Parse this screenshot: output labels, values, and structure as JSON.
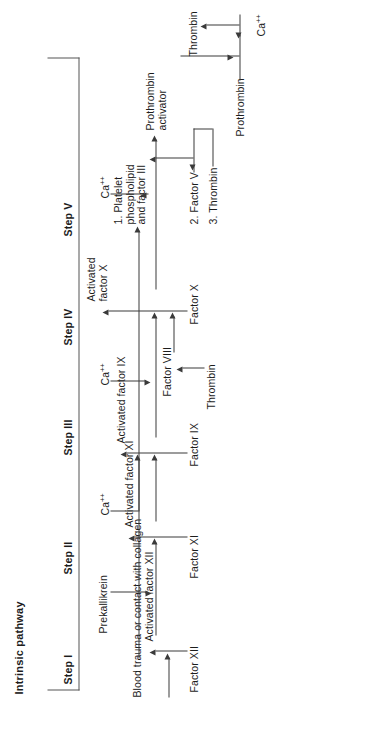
{
  "diagram": {
    "title": "Intrinsic pathway",
    "steps": [
      {
        "id": "step1",
        "label": "Step I"
      },
      {
        "id": "step2",
        "label": "Step II"
      },
      {
        "id": "step3",
        "label": "Step III"
      },
      {
        "id": "step4",
        "label": "Step IV"
      },
      {
        "id": "step5",
        "label": "Step V"
      }
    ],
    "nodes": {
      "trigger": "Blood trauma or contact with collagen",
      "factor_xii": "Factor XII",
      "activated_factor_xii": "Activated factor XII",
      "prekallikrein": "Prekallikrein",
      "factor_xi": "Factor XI",
      "activated_factor_xi": "Activated factor XI",
      "factor_ix": "Factor IX",
      "activated_factor_ix": "Activated factor IX",
      "factor_viii": "Factor VIII",
      "thrombin_viii": "Thrombin",
      "factor_x": "Factor X",
      "activated_factor_x_line1": "Activated",
      "activated_factor_x_line2": "factor X",
      "platelet_line1": "1. Platelet",
      "platelet_line2": "phospholipid",
      "platelet_line3": "and factor III",
      "factor_v": "2. Factor V",
      "thrombin_v": "3. Thrombin",
      "prothrombin_activator_line1": "Prothrombin",
      "prothrombin_activator_line2": "activator",
      "prothrombin": "Prothrombin",
      "thrombin_final": "Thrombin"
    },
    "cofactors": {
      "ca_xi": "Ca",
      "ca_xi_charge": "++",
      "ca_x": "Ca",
      "ca_x_charge": "++",
      "ca_prothrombin": "Ca",
      "ca_prothrombin_charge": "++"
    }
  }
}
